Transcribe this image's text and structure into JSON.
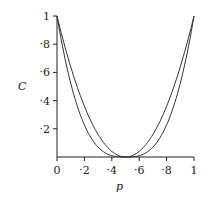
{
  "chart_data": {
    "type": "line",
    "title": "",
    "xlabel": "p",
    "ylabel": "C",
    "xlim": [
      0,
      1
    ],
    "ylim": [
      0,
      1
    ],
    "x_ticks": [
      "0",
      "·2",
      "·4",
      "·6",
      "·8",
      "1"
    ],
    "y_ticks": [
      "·2",
      "·4",
      "·6",
      "·8",
      "1"
    ],
    "grid": false,
    "legend": null,
    "series": [
      {
        "name": "outer curve",
        "x": [
          0,
          0.1,
          0.2,
          0.3,
          0.4,
          0.5,
          0.6,
          0.7,
          0.8,
          0.9,
          1
        ],
        "values": [
          1,
          0.64,
          0.36,
          0.16,
          0.04,
          0,
          0.04,
          0.16,
          0.36,
          0.64,
          1
        ]
      },
      {
        "name": "inner curve",
        "x": [
          0,
          0.1,
          0.2,
          0.3,
          0.4,
          0.5,
          0.6,
          0.7,
          0.8,
          0.9,
          1
        ],
        "values": [
          1,
          0.51,
          0.22,
          0.06,
          0.01,
          0,
          0.01,
          0.06,
          0.22,
          0.51,
          1
        ]
      }
    ]
  }
}
